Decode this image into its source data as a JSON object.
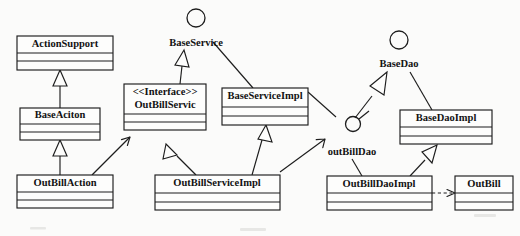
{
  "diagram": {
    "kind": "uml-class-diagram",
    "background_color": "#fbfbfa",
    "line_color": "#1d1d1d",
    "box_fill": "#fdfdfc",
    "classes": [
      {
        "id": "action-support",
        "name": "ActionSupport",
        "stereotype": "",
        "x": 17,
        "y": 36,
        "w": 96,
        "h": 34,
        "name_band_h": 17,
        "compartments": 2
      },
      {
        "id": "base-aciton",
        "name": "BaseAciton",
        "stereotype": "",
        "x": 20,
        "y": 108,
        "w": 80,
        "h": 32,
        "name_band_h": 16,
        "compartments": 2
      },
      {
        "id": "out-bill-action",
        "name": "OutBillAction",
        "stereotype": "",
        "x": 17,
        "y": 175,
        "w": 96,
        "h": 33,
        "name_band_h": 17,
        "compartments": 2
      },
      {
        "id": "out-bill-servic",
        "name": "OutBillServic",
        "stereotype": "<<Interface>>",
        "x": 124,
        "y": 84,
        "w": 82,
        "h": 46,
        "name_band_h": 30,
        "compartments": 2
      },
      {
        "id": "base-service-impl",
        "name": "BaseServiceImpl",
        "stereotype": "",
        "x": 222,
        "y": 88,
        "w": 86,
        "h": 37,
        "name_band_h": 19,
        "compartments": 2
      },
      {
        "id": "out-bill-service-impl",
        "name": "OutBillServiceImpl",
        "stereotype": "",
        "x": 155,
        "y": 175,
        "w": 125,
        "h": 35,
        "name_band_h": 18,
        "compartments": 2
      },
      {
        "id": "base-dao-impl",
        "name": "BaseDaoImpl",
        "stereotype": "",
        "x": 400,
        "y": 110,
        "w": 92,
        "h": 34,
        "name_band_h": 17,
        "compartments": 2
      },
      {
        "id": "out-bill-dao-impl",
        "name": "OutBillDaoImpl",
        "stereotype": "",
        "x": 327,
        "y": 176,
        "w": 105,
        "h": 34,
        "name_band_h": 17,
        "compartments": 2
      },
      {
        "id": "out-bill",
        "name": "OutBill",
        "stereotype": "",
        "x": 455,
        "y": 176,
        "w": 58,
        "h": 34,
        "name_band_h": 17,
        "compartments": 2
      }
    ],
    "interfaces": [
      {
        "id": "base-service",
        "label": "BaseService",
        "circle_cx": 196,
        "circle_cy": 18,
        "circle_r": 9,
        "label_x": 196,
        "label_y": 43
      },
      {
        "id": "base-dao",
        "label": "BaseDao",
        "circle_cx": 399,
        "circle_cy": 40,
        "circle_r": 9,
        "label_x": 399,
        "label_y": 64
      },
      {
        "id": "out-bill-dao",
        "label": "outBillDao",
        "circle_cx": 353,
        "circle_cy": 124,
        "circle_r": 7.5,
        "label_x": 352,
        "label_y": 152
      }
    ],
    "relationships": [
      {
        "id": "base-aciton-extends-action-support",
        "type": "generalization",
        "from": "base-aciton",
        "to": "action-support"
      },
      {
        "id": "out-bill-action-extends-base-aciton",
        "type": "generalization",
        "from": "out-bill-action",
        "to": "base-aciton"
      },
      {
        "id": "out-bill-action-uses-out-bill-servic",
        "type": "association",
        "from": "out-bill-action",
        "to": "out-bill-servic"
      },
      {
        "id": "out-bill-servic-realizes-base-service",
        "type": "realization",
        "from": "out-bill-servic",
        "to": "base-service"
      },
      {
        "id": "base-service-impl-realizes-base-service",
        "type": "realization",
        "from": "base-service-impl",
        "to": "base-service"
      },
      {
        "id": "out-bill-service-impl-implements-out-bill-servic",
        "type": "generalization",
        "from": "out-bill-service-impl",
        "to": "out-bill-servic"
      },
      {
        "id": "out-bill-service-impl-extends-base-service-impl",
        "type": "generalization",
        "from": "out-bill-service-impl",
        "to": "base-service-impl"
      },
      {
        "id": "out-bill-service-impl-uses-out-bill-dao",
        "type": "association",
        "from": "out-bill-service-impl",
        "to": "out-bill-dao"
      },
      {
        "id": "out-bill-dao-impl-realizes-out-bill-dao",
        "type": "realization",
        "from": "out-bill-dao-impl",
        "to": "out-bill-dao"
      },
      {
        "id": "out-bill-dao-impl-extends-base-dao-impl",
        "type": "generalization",
        "from": "out-bill-dao-impl",
        "to": "base-dao-impl"
      },
      {
        "id": "base-dao-impl-realizes-base-dao",
        "type": "realization",
        "from": "base-dao-impl",
        "to": "base-dao"
      },
      {
        "id": "out-bill-dao-impl-depends-out-bill",
        "type": "dependency",
        "from": "out-bill-dao-impl",
        "to": "out-bill"
      }
    ]
  }
}
